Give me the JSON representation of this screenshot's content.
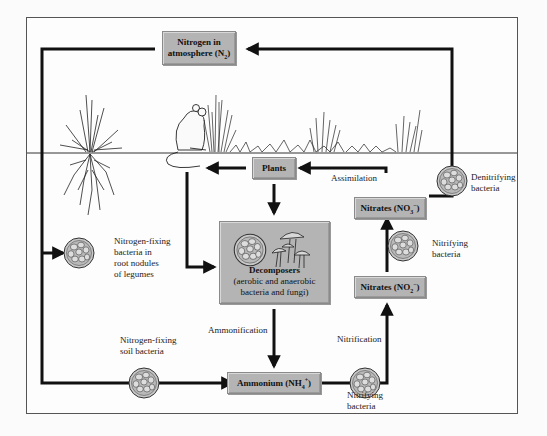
{
  "diagram": {
    "colors": {
      "box_fill": "#b4b4b4",
      "box_border": "#8a8a8a",
      "arrow": "#111111",
      "frame": "#555555",
      "background": "#fdfdfd"
    },
    "nodes": {
      "atmosphere": {
        "line1": "Nitrogen in",
        "line2": "atmosphere (N",
        "sub": "2",
        "line2_end": ")"
      },
      "plants": {
        "label": "Plants"
      },
      "decomposers": {
        "title": "Decomposers",
        "line1": "(aerobic and anaerobic",
        "line2": "bacteria and fungi)"
      },
      "ammonium": {
        "label": "Ammonium (NH",
        "sub": "4",
        "sup": "+",
        "end": ")"
      },
      "nitrites": {
        "label": "Nitrates (NO",
        "sub": "2",
        "sup": "−",
        "end": ")"
      },
      "nitrates": {
        "label": "Nitrates (NO",
        "sub": "3",
        "sup": "−",
        "end": ")"
      }
    },
    "process_labels": {
      "assimilation": "Assimilation",
      "ammonification": "Ammonification",
      "nitrification": "Nitrification"
    },
    "organism_labels": {
      "denitrifying": [
        "Denitrifying",
        "bacteria"
      ],
      "nitrifying_upper": [
        "Nitrifying",
        "bacteria"
      ],
      "nitrifying_lower": [
        "Nitrifying",
        "bacteria"
      ],
      "root_nodules": [
        "Nitrogen-fixing",
        "bacteria in",
        "root nodules",
        "of legumes"
      ],
      "soil_bacteria": [
        "Nitrogen-fixing",
        "soil bacteria"
      ]
    },
    "edges": [
      {
        "from": "atmosphere",
        "to": "root_nodule_bacteria"
      },
      {
        "from": "atmosphere",
        "to": "soil_bacteria"
      },
      {
        "from": "soil_bacteria",
        "to": "ammonium"
      },
      {
        "from": "decomposers",
        "to": "ammonium",
        "label": "Ammonification"
      },
      {
        "from": "ammonium",
        "to": "nitrites",
        "label": "Nitrification"
      },
      {
        "from": "nitrites",
        "to": "nitrates"
      },
      {
        "from": "nitrates",
        "to": "plants",
        "label": "Assimilation"
      },
      {
        "from": "nitrates",
        "to": "atmosphere",
        "via": "denitrifying bacteria"
      },
      {
        "from": "plants",
        "to": "decomposers"
      },
      {
        "from": "plants",
        "to": "animals"
      },
      {
        "from": "animals",
        "to": "decomposers"
      }
    ]
  }
}
